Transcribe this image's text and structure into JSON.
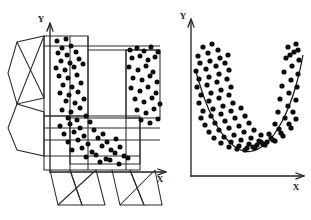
{
  "figure": {
    "name": "paired-scatter-figure",
    "background_color": "#ffffff",
    "ink_color": "#0d0d0d",
    "point_color": "#0d0d0d",
    "line_color": "#2a2a2a"
  },
  "panels": [
    {
      "id": "left",
      "name": "unfolded-net-scatter-panel",
      "axes": {
        "y_label": "Y",
        "x_label": "X",
        "y_label_pos": [
          44,
          19
        ],
        "x_label_pos": [
          160,
          179
        ],
        "y_axis": {
          "x": 50,
          "y_top": 22,
          "y_bottom": 172
        },
        "x_axis": {
          "y": 172,
          "x_left": 50,
          "x_right": 165
        }
      },
      "has_fit_curve": false,
      "wireframe_note": "carton-net style outline with side flaps, crossing diagonals and horizontal fold lines"
    },
    {
      "id": "right",
      "name": "u-curve-scatter-panel",
      "axes": {
        "y_label": "Y",
        "x_label": "X",
        "y_label_pos": [
          185,
          16
        ],
        "x_label_pos": [
          296,
          187
        ],
        "y_axis": {
          "x": 191,
          "y_top": 19,
          "y_bottom": 176
        },
        "x_axis": {
          "y": 176,
          "x_left": 191,
          "x_right": 303
        }
      },
      "has_fit_curve": true,
      "fit_curve_type": "quadratic"
    }
  ],
  "chart_data": {
    "type": "scatter",
    "title": "",
    "xlabel": "X",
    "ylabel": "Y",
    "grid": false,
    "legend": null,
    "xlim": [
      0,
      100
    ],
    "ylim": [
      0,
      100
    ],
    "charts": [
      {
        "id": "left",
        "type": "scatter",
        "title": "",
        "xlabel": "X",
        "ylabel": "Y",
        "note": "Same U-shaped sample, split across the unfolded net panels",
        "series": [
          {
            "name": "left-limb-cluster",
            "points": [
              [
                57,
                41
              ],
              [
                66,
                39
              ],
              [
                62,
                48
              ],
              [
                71,
                46
              ],
              [
                58,
                53
              ],
              [
                67,
                55
              ],
              [
                76,
                52
              ],
              [
                61,
                61
              ],
              [
                70,
                63
              ],
              [
                79,
                59
              ],
              [
                56,
                68
              ],
              [
                65,
                70
              ],
              [
                74,
                67
              ],
              [
                83,
                64
              ],
              [
                59,
                76
              ],
              [
                68,
                78
              ],
              [
                77,
                75
              ],
              [
                63,
                85
              ],
              [
                72,
                87
              ],
              [
                81,
                83
              ],
              [
                60,
                93
              ],
              [
                69,
                95
              ],
              [
                78,
                92
              ],
              [
                66,
                101
              ],
              [
                75,
                103
              ],
              [
                84,
                99
              ],
              [
                62,
                110
              ],
              [
                71,
                112
              ],
              [
                80,
                108
              ],
              [
                68,
                118
              ],
              [
                77,
                120
              ],
              [
                86,
                116
              ]
            ]
          },
          {
            "name": "bottom-cluster",
            "points": [
              [
                60,
                126
              ],
              [
                70,
                124
              ],
              [
                80,
                128
              ],
              [
                90,
                122
              ],
              [
                64,
                134
              ],
              [
                74,
                132
              ],
              [
                84,
                136
              ],
              [
                94,
                130
              ],
              [
                103,
                134
              ],
              [
                68,
                142
              ],
              [
                78,
                140
              ],
              [
                88,
                144
              ],
              [
                98,
                138
              ],
              [
                107,
                142
              ],
              [
                116,
                139
              ],
              [
                72,
                150
              ],
              [
                82,
                148
              ],
              [
                92,
                152
              ],
              [
                102,
                146
              ],
              [
                111,
                150
              ],
              [
                120,
                147
              ],
              [
                86,
                157
              ],
              [
                96,
                155
              ],
              [
                106,
                159
              ],
              [
                115,
                153
              ],
              [
                124,
                156
              ],
              [
                100,
                162
              ],
              [
                110,
                160
              ],
              [
                119,
                164
              ],
              [
                128,
                158
              ]
            ]
          },
          {
            "name": "right-limb-cluster",
            "points": [
              [
                130,
                50
              ],
              [
                137,
                48
              ],
              [
                144,
                51
              ],
              [
                151,
                47
              ],
              [
                158,
                52
              ],
              [
                132,
                58
              ],
              [
                140,
                56
              ],
              [
                148,
                60
              ],
              [
                155,
                57
              ],
              [
                129,
                67
              ],
              [
                138,
                70
              ],
              [
                146,
                66
              ],
              [
                153,
                72
              ],
              [
                133,
                78
              ],
              [
                142,
                80
              ],
              [
                150,
                76
              ],
              [
                157,
                82
              ],
              [
                131,
                88
              ],
              [
                140,
                91
              ],
              [
                148,
                87
              ],
              [
                156,
                93
              ],
              [
                135,
                99
              ],
              [
                144,
                102
              ],
              [
                152,
                98
              ],
              [
                160,
                104
              ],
              [
                137,
                110
              ],
              [
                146,
                113
              ],
              [
                154,
                109
              ],
              [
                141,
                120
              ],
              [
                150,
                123
              ],
              [
                158,
                119
              ]
            ]
          }
        ]
      },
      {
        "id": "right",
        "type": "scatter",
        "title": "",
        "xlabel": "X",
        "ylabel": "Y",
        "grid": false,
        "has_fit_curve": true,
        "fit_curve_type": "quadratic",
        "fit_curve_label": "fitted U curve",
        "series": [
          {
            "name": "u-shaped-sample",
            "points": [
              [
                203,
                47
              ],
              [
                212,
                44
              ],
              [
                198,
                56
              ],
              [
                208,
                53
              ],
              [
                218,
                50
              ],
              [
                200,
                63
              ],
              [
                210,
                61
              ],
              [
                220,
                58
              ],
              [
                228,
                55
              ],
              [
                196,
                71
              ],
              [
                206,
                69
              ],
              [
                216,
                66
              ],
              [
                225,
                63
              ],
              [
                199,
                79
              ],
              [
                209,
                77
              ],
              [
                219,
                74
              ],
              [
                229,
                70
              ],
              [
                197,
                87
              ],
              [
                207,
                85
              ],
              [
                217,
                82
              ],
              [
                227,
                79
              ],
              [
                201,
                95
              ],
              [
                211,
                93
              ],
              [
                221,
                90
              ],
              [
                231,
                87
              ],
              [
                199,
                103
              ],
              [
                209,
                101
              ],
              [
                219,
                98
              ],
              [
                229,
                95
              ],
              [
                203,
                111
              ],
              [
                213,
                109
              ],
              [
                223,
                106
              ],
              [
                233,
                103
              ],
              [
                201,
                118
              ],
              [
                211,
                116
              ],
              [
                221,
                114
              ],
              [
                231,
                111
              ],
              [
                241,
                108
              ],
              [
                205,
                125
              ],
              [
                215,
                123
              ],
              [
                225,
                121
              ],
              [
                235,
                118
              ],
              [
                245,
                116
              ],
              [
                209,
                132
              ],
              [
                219,
                130
              ],
              [
                229,
                128
              ],
              [
                239,
                126
              ],
              [
                249,
                123
              ],
              [
                214,
                138
              ],
              [
                224,
                137
              ],
              [
                234,
                135
              ],
              [
                244,
                132
              ],
              [
                254,
                130
              ],
              [
                221,
                143
              ],
              [
                231,
                142
              ],
              [
                241,
                140
              ],
              [
                251,
                138
              ],
              [
                261,
                135
              ],
              [
                229,
                147
              ],
              [
                239,
                146
              ],
              [
                249,
                144
              ],
              [
                259,
                141
              ],
              [
                237,
                149
              ],
              [
                247,
                148
              ],
              [
                257,
                145
              ],
              [
                267,
                142
              ],
              [
                245,
                150
              ],
              [
                255,
                148
              ],
              [
                265,
                145
              ],
              [
                275,
                141
              ],
              [
                253,
                147
              ],
              [
                263,
                144
              ],
              [
                273,
                140
              ],
              [
                283,
                136
              ],
              [
                261,
                142
              ],
              [
                271,
                138
              ],
              [
                281,
                133
              ],
              [
                291,
                128
              ],
              [
                269,
                134
              ],
              [
                279,
                129
              ],
              [
                289,
                124
              ],
              [
                296,
                119
              ],
              [
                275,
                124
              ],
              [
                285,
                118
              ],
              [
                293,
                112
              ],
              [
                278,
                112
              ],
              [
                288,
                106
              ],
              [
                296,
                100
              ],
              [
                280,
                99
              ],
              [
                289,
                93
              ],
              [
                297,
                87
              ],
              [
                282,
                86
              ],
              [
                291,
                80
              ],
              [
                298,
                74
              ],
              [
                284,
                72
              ],
              [
                292,
                66
              ],
              [
                299,
                60
              ],
              [
                286,
                58
              ],
              [
                294,
                52
              ],
              [
                288,
                47
              ],
              [
                296,
                44
              ],
              [
                290,
                55
              ],
              [
                298,
                50
              ]
            ]
          }
        ],
        "fit_curve_points": [
          [
            196,
            72
          ],
          [
            202,
            92
          ],
          [
            208,
            108
          ],
          [
            215,
            123
          ],
          [
            222,
            134
          ],
          [
            230,
            143
          ],
          [
            238,
            149
          ],
          [
            246,
            152
          ],
          [
            254,
            151
          ],
          [
            262,
            147
          ],
          [
            270,
            140
          ],
          [
            278,
            129
          ],
          [
            286,
            114
          ],
          [
            293,
            96
          ],
          [
            299,
            75
          ],
          [
            303,
            55
          ]
        ]
      }
    ]
  }
}
